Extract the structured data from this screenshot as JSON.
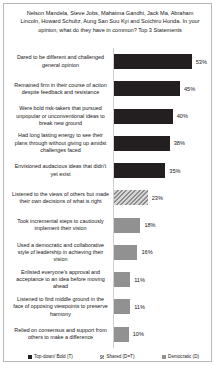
{
  "chart_data": {
    "type": "bar",
    "orientation": "horizontal",
    "title": "Nelson Mandela, Steve Jobs, Mahatma Gandhi, Jack Ma, Abraham Lincoln, Howard Schultz, Aung San Suu Kyi and Soichiro Honda. In your opinion, what do they have in common? Top 3 Statements",
    "xlabel": "",
    "ylabel": "",
    "xlim": [
      0,
      60
    ],
    "grid": false,
    "legend_position": "bottom",
    "categories": [
      "Dared to be different and challenged general opinion",
      "Remained firm in their course of action despite feedback and resistance",
      "Were bold risk-takers that pursued unpopular or unconventional ideas to break new ground",
      "Had long lasting energy to see their plans through without giving up amidst challenges faced",
      "Envisioned audacious  ideas that didn't yet exist",
      "Listened to the views of others but made their own decisions of what is right",
      "Took incremental steps to cautiously implement their vision",
      "Used a democratic and collaborative style of leadership  in achieving their vision",
      "Enlisted everyone's approval and acceptance to an idea before moving ahead",
      "Listened to find middle ground in the face of opposing viewpoints  to preserve harmony",
      "Relied on consensus and support from others to make a difference"
    ],
    "values": [
      53,
      45,
      40,
      38,
      35,
      23,
      18,
      16,
      11,
      11,
      10
    ],
    "value_labels": [
      "53%",
      "45%",
      "40%",
      "38%",
      "35%",
      "23%",
      "18%",
      "16%",
      "11%",
      "11%",
      "10%"
    ],
    "series_keys": [
      "topdown",
      "topdown",
      "topdown",
      "topdown",
      "topdown",
      "shared",
      "democratic",
      "democratic",
      "democratic",
      "democratic",
      "democratic"
    ],
    "legend": [
      {
        "key": "topdown",
        "label": "Top-down/ Bold (T)",
        "color": "#231f20"
      },
      {
        "key": "shared",
        "label": "Shared (D=T)",
        "color": "#8d8d8d"
      },
      {
        "key": "democratic",
        "label": "Democratic (D)",
        "color": "#919191"
      }
    ]
  }
}
